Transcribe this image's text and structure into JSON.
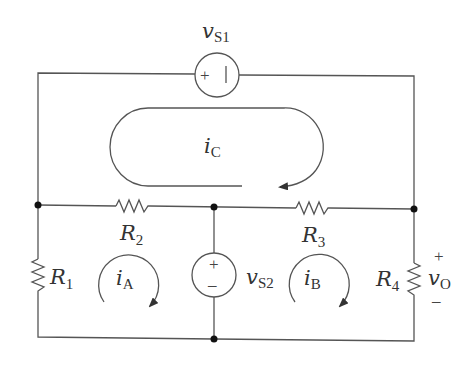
{
  "diagram": {
    "type": "circuit",
    "colors": {
      "wire": "#555555",
      "node": "#111111",
      "text": "#333333",
      "background": "#ffffff"
    },
    "sources": [
      {
        "id": "vS1",
        "symbol": "v",
        "subscript": "S1",
        "polarity_left": "+",
        "polarity_right": "|"
      },
      {
        "id": "vS2",
        "symbol": "v",
        "subscript": "S2",
        "polarity_top": "+",
        "polarity_bottom": "–"
      }
    ],
    "resistors": [
      {
        "id": "R1",
        "symbol": "R",
        "subscript": "1"
      },
      {
        "id": "R2",
        "symbol": "R",
        "subscript": "2"
      },
      {
        "id": "R3",
        "symbol": "R",
        "subscript": "3"
      },
      {
        "id": "R4",
        "symbol": "R",
        "subscript": "4"
      }
    ],
    "mesh_currents": [
      {
        "id": "iA",
        "symbol": "i",
        "subscript": "A",
        "direction": "clockwise"
      },
      {
        "id": "iB",
        "symbol": "i",
        "subscript": "B",
        "direction": "clockwise"
      },
      {
        "id": "iC",
        "symbol": "i",
        "subscript": "C",
        "direction": "clockwise"
      }
    ],
    "output": {
      "symbol": "v",
      "subscript": "O",
      "plus": "+",
      "minus": "–"
    }
  }
}
